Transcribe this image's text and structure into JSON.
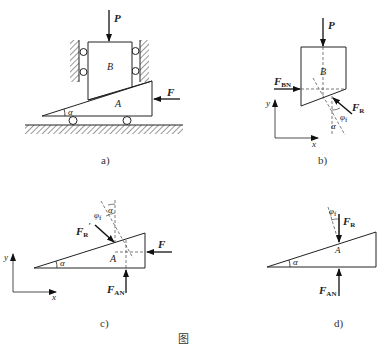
{
  "figure": {
    "panels": [
      {
        "id": "a",
        "caption": "a)",
        "labels": {
          "force_p": "P",
          "block_b": "B",
          "wedge_a": "A",
          "force_f": "F",
          "angle": "α"
        }
      },
      {
        "id": "b",
        "caption": "b)",
        "labels": {
          "force_p": "P",
          "block_b": "B",
          "force_bn": "F",
          "force_bn_sub": "BN",
          "force_r": "F",
          "force_r_sub": "R",
          "angle_phi": "φ",
          "angle_phi_sub": "f",
          "angle_alpha": "α",
          "axis_x": "x",
          "axis_y": "y"
        }
      },
      {
        "id": "c",
        "caption": "c)",
        "labels": {
          "force_r_prime": "F",
          "force_r_prime_sub": "R",
          "prime": "′",
          "angle_phi": "φ",
          "angle_phi_sub": "f",
          "angle_alpha_top": "α",
          "angle_alpha": "α",
          "wedge_a": "A",
          "force_f": "F",
          "force_an": "F",
          "force_an_sub": "AN",
          "axis_x": "x",
          "axis_y": "y"
        }
      },
      {
        "id": "d",
        "caption": "d)",
        "labels": {
          "angle_phi": "φ",
          "angle_phi_sub": "f",
          "force_r": "F",
          "force_r_sub": "R",
          "wedge_a": "A",
          "angle_alpha": "α",
          "force_an": "F",
          "force_an_sub": "AN"
        }
      }
    ],
    "figure_caption": "图"
  }
}
